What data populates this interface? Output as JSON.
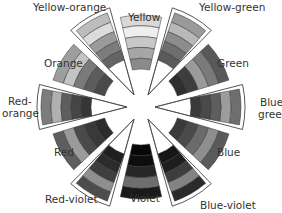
{
  "diagram": {
    "type": "color-wheel",
    "center": [
      141,
      107
    ],
    "segments": [
      {
        "name": "Yellow",
        "kind": "primary",
        "angle": 0,
        "shades": [
          "#d8d8d8",
          "#eeeeee",
          "#c8c8c8",
          "#a6a6a6",
          "#8a8a8a"
        ]
      },
      {
        "name": "Yellow-green",
        "kind": "tertiary",
        "angle": 30,
        "shades": [
          "#9a9a9a",
          "#b8b8b8",
          "#8c8c8c",
          "#6e6e6e",
          "#5a5a5a"
        ]
      },
      {
        "name": "Green",
        "kind": "secondary",
        "angle": 60,
        "shades": [
          "#595959",
          "#7a7a7a",
          "#9a9a9a",
          "#3d3d3d",
          "#2e2e2e"
        ]
      },
      {
        "name": "Blue-green",
        "kind": "tertiary",
        "angle": 90,
        "shades": [
          "#6f6f6f",
          "#9c9c9c",
          "#5e5e5e",
          "#494949",
          "#3a3a3a"
        ]
      },
      {
        "name": "Blue",
        "kind": "secondary",
        "angle": 120,
        "shades": [
          "#5a5a5a",
          "#8e8e8e",
          "#6b6b6b",
          "#4a4a4a",
          "#3a3a3a"
        ]
      },
      {
        "name": "Blue-violet",
        "kind": "tertiary",
        "angle": 150,
        "shades": [
          "#2b2b2b",
          "#838383",
          "#3d3d3d",
          "#1e1e1e",
          "#161616"
        ]
      },
      {
        "name": "Violet",
        "kind": "primary",
        "angle": 180,
        "shades": [
          "#1a1a1a",
          "#6e6e6e",
          "#262626",
          "#0e0e0e",
          "#080808"
        ]
      },
      {
        "name": "Red-violet",
        "kind": "tertiary",
        "angle": 210,
        "shades": [
          "#4d4d4d",
          "#8f8f8f",
          "#3e3e3e",
          "#2c2c2c",
          "#1f1f1f"
        ]
      },
      {
        "name": "Red",
        "kind": "primary",
        "angle": 240,
        "shades": [
          "#5e5e5e",
          "#9a9a9a",
          "#4a4a4a",
          "#393939",
          "#2c2c2c"
        ]
      },
      {
        "name": "Red-orange",
        "kind": "tertiary",
        "angle": 270,
        "shades": [
          "#7c7c7c",
          "#b0b0b0",
          "#5e5e5e",
          "#454545",
          "#363636"
        ]
      },
      {
        "name": "Orange",
        "kind": "secondary",
        "angle": 300,
        "shades": [
          "#9e9e9e",
          "#c4c4c4",
          "#7a7a7a",
          "#5c5c5c",
          "#4a4a4a"
        ]
      },
      {
        "name": "Yellow-orange",
        "kind": "tertiary",
        "angle": 330,
        "shades": [
          "#bdbdbd",
          "#dcdcdc",
          "#9a9a9a",
          "#7c7c7c",
          "#646464"
        ]
      }
    ]
  },
  "labels": {
    "yellow": "Yellow",
    "yellow_green": "Yellow-green",
    "green": "Green",
    "blue_green_1": "Blue-",
    "blue_green_2": "green",
    "blue": "Blue",
    "blue_violet": "Blue-violet",
    "violet": "Violet",
    "red_violet": "Red-violet",
    "red": "Red",
    "red_orange_1": "Red-",
    "red_orange_2": "orange",
    "orange": "Orange",
    "yellow_orange": "Yellow-orange"
  }
}
